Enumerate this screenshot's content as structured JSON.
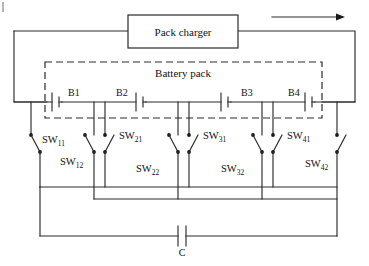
{
  "figure": {
    "type": "circuit-schematic"
  },
  "charger": {
    "label": "Pack charger",
    "box": {
      "x": 128,
      "y": 15,
      "w": 110,
      "h": 33
    }
  },
  "current_arrow": {
    "name": "current-direction-arrow",
    "direction": "right",
    "x1": 272,
    "x2": 340,
    "y": 17
  },
  "battery_pack": {
    "label": "Battery pack",
    "box": {
      "x": 45,
      "y": 62,
      "w": 277,
      "h": 56
    },
    "style": "dashed"
  },
  "cells": [
    {
      "label": "B1",
      "label_x": 68,
      "label_y": 96,
      "symbol_x": 57
    },
    {
      "label": "B2",
      "label_x": 116,
      "label_y": 96,
      "symbol_x": 141
    },
    {
      "label": "B3",
      "label_x": 241,
      "label_y": 96,
      "symbol_x": 226
    },
    {
      "label": "B4",
      "label_x": 288,
      "label_y": 96,
      "symbol_x": 310
    }
  ],
  "switches": [
    {
      "name": "SW11",
      "base": "SW",
      "sub": "11",
      "label_x": 42,
      "label_y": 143
    },
    {
      "name": "SW12",
      "base": "SW",
      "sub": "12",
      "label_x": 60,
      "label_y": 163
    },
    {
      "name": "SW21",
      "base": "SW",
      "sub": "21",
      "label_x": 119,
      "label_y": 137
    },
    {
      "name": "SW22",
      "base": "SW",
      "sub": "22",
      "label_x": 136,
      "label_y": 170
    },
    {
      "name": "SW31",
      "base": "SW",
      "sub": "31",
      "label_x": 203,
      "label_y": 137
    },
    {
      "name": "SW32",
      "base": "SW",
      "sub": "32",
      "label_x": 221,
      "label_y": 170
    },
    {
      "name": "SW41",
      "base": "SW",
      "sub": "41",
      "label_x": 287,
      "label_y": 137
    },
    {
      "name": "SW42",
      "base": "SW",
      "sub": "42",
      "label_x": 305,
      "label_y": 165
    }
  ],
  "capacitor": {
    "label": "C",
    "x": 182,
    "y": 236,
    "label_x": 182,
    "label_y": 254
  },
  "colors": {
    "wire": "#2b2b2b",
    "background": "#ffffff",
    "text": "#111111"
  }
}
